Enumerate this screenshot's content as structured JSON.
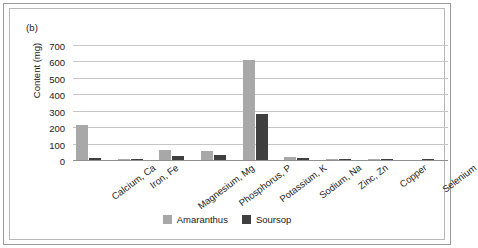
{
  "figure": {
    "panel_label": "(b)",
    "border_color": "#9a9a9a"
  },
  "chart_data": {
    "type": "bar",
    "title": "",
    "subtitle": "",
    "xlabel": "",
    "ylabel": "Content (mg)",
    "ylim": [
      0,
      700
    ],
    "yticks": [
      0,
      100,
      200,
      300,
      400,
      500,
      600,
      700
    ],
    "ytick_labels": [
      "0",
      "100",
      "200",
      "300",
      "400",
      "500",
      "600",
      "700"
    ],
    "grid": true,
    "legend_position": "bottom",
    "categories": [
      "Calcium, Ca",
      "Iron, Fe",
      "Magnesium, Mg",
      "Phosphorus, P",
      "Potassium, K",
      "Sodium, Na",
      "Zinc, Zn",
      "Copper",
      "Selenium"
    ],
    "series": [
      {
        "name": "Amaranthus",
        "color": "#a8a8a8",
        "values": [
          215,
          3,
          62,
          52,
          611,
          20,
          1,
          0.5,
          0
        ]
      },
      {
        "name": "Soursop",
        "color": "#3f3f3f",
        "values": [
          14,
          8,
          25,
          28,
          278,
          14,
          3,
          2,
          2
        ]
      }
    ]
  }
}
